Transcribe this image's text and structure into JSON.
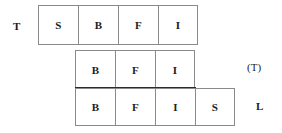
{
  "diagram": {
    "rows": [
      {
        "id": "tier-1",
        "left_label": "T",
        "right_label": "",
        "cells": [
          {
            "text": "S"
          },
          {
            "text": "B"
          },
          {
            "text": "F"
          },
          {
            "text": "I"
          }
        ]
      },
      {
        "id": "tier-2",
        "left_label": "",
        "right_label": "(T)",
        "cells": [
          {
            "text": "B"
          },
          {
            "text": "F"
          },
          {
            "text": "I"
          }
        ]
      },
      {
        "id": "tier-3",
        "left_label": "",
        "right_label": "L",
        "cells": [
          {
            "text": "B"
          },
          {
            "text": "F"
          },
          {
            "text": "I"
          },
          {
            "text": "S"
          }
        ]
      }
    ],
    "labels": {
      "t_left": "T",
      "t_right": "(T)",
      "l_right": "L"
    },
    "colors": {
      "background": "#ffffff",
      "cell_border": "#8a8a8a",
      "divider": "#2b2b2b",
      "text": "#1c1c1c"
    }
  }
}
